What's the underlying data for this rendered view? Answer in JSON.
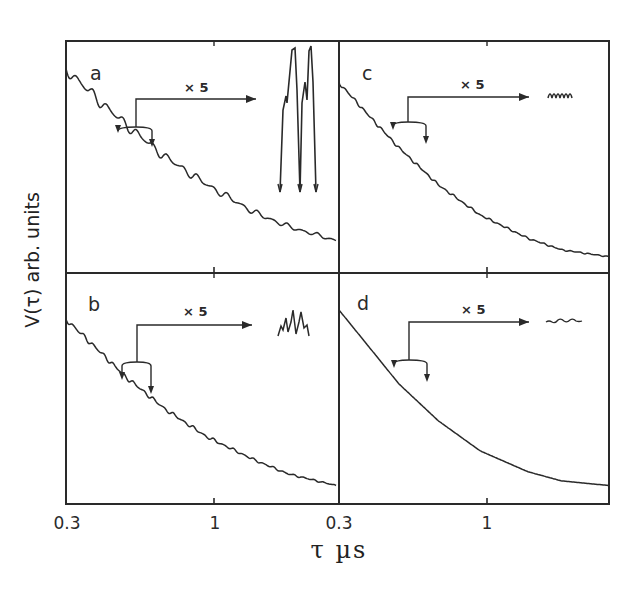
{
  "chart_data": [
    {
      "type": "line",
      "panel": "a",
      "title": "",
      "xlabel": "τ µs",
      "ylabel": "V(τ) arb. units",
      "xscale": "log",
      "xlim": [
        0.3,
        3.0
      ],
      "x_ticks": [
        0.3,
        1
      ],
      "x_tick_labels": [
        "0.3",
        "1"
      ],
      "annotation": "× 5",
      "description": "Decaying curve with strong superimposed oscillations; inset enlarged ×5 shows large two-peak (doublet) modulation",
      "series": [
        {
          "name": "V(τ)",
          "x": [
            0.3,
            0.4,
            0.5,
            0.7,
            1.0,
            1.5,
            2.0,
            3.0
          ],
          "y": [
            0.88,
            0.74,
            0.64,
            0.5,
            0.38,
            0.26,
            0.2,
            0.14
          ]
        }
      ],
      "modulation_depth": "strong"
    },
    {
      "type": "line",
      "panel": "b",
      "xlabel": "τ µs",
      "ylabel": "V(τ) arb. units",
      "xscale": "log",
      "xlim": [
        0.3,
        3.0
      ],
      "x_ticks": [
        0.3,
        1
      ],
      "x_tick_labels": [
        "0.3",
        "1"
      ],
      "annotation": "× 5",
      "description": "Decaying curve with weak oscillations; inset enlarged ×5 shows moderate multi-peak modulation",
      "series": [
        {
          "name": "V(τ)",
          "x": [
            0.3,
            0.4,
            0.5,
            0.7,
            1.0,
            1.5,
            2.0,
            3.0
          ],
          "y": [
            0.8,
            0.66,
            0.55,
            0.41,
            0.29,
            0.19,
            0.13,
            0.08
          ]
        }
      ],
      "modulation_depth": "moderate"
    },
    {
      "type": "line",
      "panel": "c",
      "xlabel": "τ µs",
      "ylabel": "V(τ) arb. units",
      "xscale": "log",
      "xlim": [
        0.3,
        3.0
      ],
      "x_ticks": [
        0.3,
        1
      ],
      "x_tick_labels": [
        "0.3",
        "1"
      ],
      "annotation": "× 5",
      "description": "Decaying curve with small ripples; inset enlarged ×5 shows small regular oscillation",
      "series": [
        {
          "name": "V(τ)",
          "x": [
            0.3,
            0.4,
            0.5,
            0.7,
            1.0,
            1.5,
            2.0,
            3.0
          ],
          "y": [
            0.82,
            0.66,
            0.54,
            0.38,
            0.25,
            0.15,
            0.1,
            0.07
          ]
        }
      ],
      "modulation_depth": "weak"
    },
    {
      "type": "line",
      "panel": "d",
      "xlabel": "τ µs",
      "ylabel": "V(τ) arb. units",
      "xscale": "log",
      "xlim": [
        0.3,
        3.0
      ],
      "x_ticks": [
        0.3,
        1
      ],
      "x_tick_labels": [
        "0.3",
        "1"
      ],
      "annotation": "× 5",
      "description": "Smooth decaying curve; inset enlarged ×5 shows nearly flat noise-level trace",
      "series": [
        {
          "name": "V(τ)",
          "x": [
            0.3,
            0.4,
            0.5,
            0.7,
            1.0,
            1.5,
            2.0,
            3.0
          ],
          "y": [
            0.84,
            0.66,
            0.52,
            0.36,
            0.23,
            0.14,
            0.1,
            0.08
          ]
        }
      ],
      "modulation_depth": "negligible"
    }
  ],
  "figure": {
    "panels": [
      "a",
      "b",
      "c",
      "d"
    ],
    "multiplier_label": "× 5",
    "x_axis_label": "τ µs",
    "y_axis_label": "V(τ) arb. units",
    "x_tick_labels_bottom": [
      "0.3",
      "1",
      "0.3",
      "1"
    ],
    "line_color": "#2a2a2a"
  }
}
